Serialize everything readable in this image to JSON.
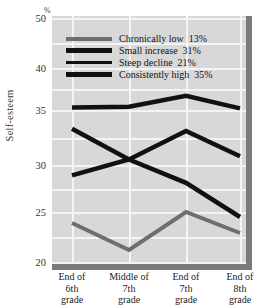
{
  "chart_data": {
    "type": "line",
    "title": "",
    "xlabel": "",
    "ylabel": "Self-esteem",
    "unit_label": "%",
    "categories": [
      "End of\n6th\ngrade",
      "Middle of\n7th\ngrade",
      "End of\n7th\ngrade",
      "End of\n8th\ngrade"
    ],
    "category_lines": [
      [
        "End of",
        "6th",
        "grade"
      ],
      [
        "Middle of",
        "7th",
        "grade"
      ],
      [
        "End of",
        "7th",
        "grade"
      ],
      [
        "End of",
        "8th",
        "grade"
      ]
    ],
    "ylim": [
      20,
      50
    ],
    "yticks": [
      50,
      40,
      35,
      30,
      25,
      20
    ],
    "ytick_labels": [
      "50",
      "40",
      "35",
      "30",
      "25",
      "20"
    ],
    "y_axis_nonlinear": true,
    "grid": true,
    "legend_position": "upper-left-inside",
    "series": [
      {
        "name": "Chronically low",
        "share": "13%",
        "color": "#6e6e6e",
        "values": [
          23.9,
          21.2,
          25.0,
          22.9
        ]
      },
      {
        "name": "Small increase",
        "share": "31%",
        "color": "#111111",
        "values": [
          28.9,
          30.5,
          33.1,
          30.8
        ]
      },
      {
        "name": "Steep decline",
        "share": "21%",
        "color": "#111111",
        "values": [
          33.3,
          30.5,
          28.1,
          24.5
        ]
      },
      {
        "name": "Consistently high",
        "share": "35%",
        "color": "#111111",
        "values": [
          35.3,
          35.4,
          36.7,
          35.2
        ]
      }
    ]
  },
  "legend": {
    "rows": [
      {
        "label": "Chronically low",
        "share": "13%",
        "color": "#6e6e6e",
        "thickness": 4
      },
      {
        "label": "Small increase",
        "share": "31%",
        "color": "#111111",
        "thickness": 5
      },
      {
        "label": "Steep decline",
        "share": "21%",
        "color": "#111111",
        "thickness": 3
      },
      {
        "label": "Consistently high",
        "share": "35%",
        "color": "#111111",
        "thickness": 5
      }
    ]
  },
  "colors": {
    "plot_background": "#d8d8d8",
    "gridline": "#f4f4f4",
    "axis_bar": "#7a7a7a",
    "page_background": "#ffffff"
  }
}
